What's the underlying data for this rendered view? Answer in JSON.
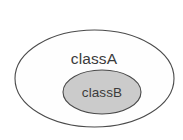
{
  "diagram": {
    "type": "venn-containment",
    "background_color": "#ffffff",
    "shapes": {
      "outer": {
        "label": "classA",
        "shape": "ellipse",
        "cx": 94.5,
        "cy": 78.5,
        "rx": 79.5,
        "ry": 48.5,
        "fill_color": "#fefefe",
        "stroke_color": "#4a4a4a",
        "stroke_width": 1.1,
        "label_x": 94,
        "label_y": 60
      },
      "inner": {
        "label": "classB",
        "shape": "ellipse",
        "cx": 102,
        "cy": 92,
        "rx": 39,
        "ry": 22,
        "fill_color": "#cbcbcb",
        "stroke_color": "#4a4a4a",
        "stroke_width": 1.1,
        "label_x": 102,
        "label_y": 93
      }
    },
    "text_color": "#3b3b3b"
  }
}
